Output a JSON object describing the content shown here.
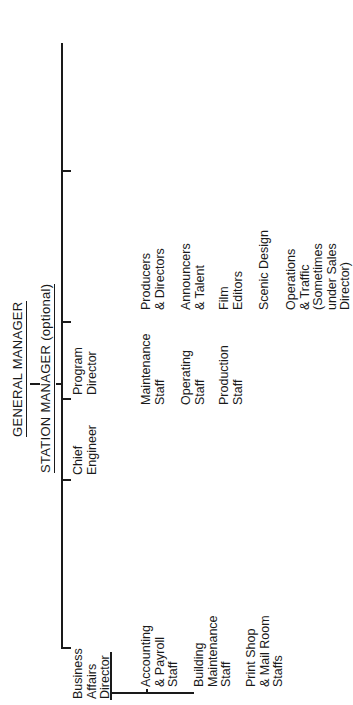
{
  "chart": {
    "title_top": "GENERAL MANAGER",
    "title_sub": "STATION MANAGER (optional)",
    "departments": [
      {
        "head": "Business\nAffairs\nDirector",
        "staff": [
          "Accounting\n& Payroll\nStaff",
          "Building\nMaintenance\nStaff",
          "Print Shop\n& Mail Room\nStaffs"
        ]
      },
      {
        "head": "Chief\nEngineer",
        "staff": [
          "Maintenance\nStaff",
          "Operating\nStaff",
          "Production\nStaff"
        ]
      },
      {
        "head": "Program\nDirector",
        "staff": [
          "Producers\n& Directors",
          "Announcers\n& Talent",
          "Film\nEditors",
          "Scenic Design",
          "Operations\n& Traffic\n(Sometimes\nunder Sales\nDirector)"
        ]
      },
      {
        "head": "Community\nAffairs\n(or Relations)\nDirector",
        "staff": [
          "FCC License",
          "Ascertainments",
          "Public Service"
        ]
      },
      {
        "head": "Sales\nDirector",
        "staff": [
          "Sales\nStaff",
          "Research\nStaff"
        ]
      },
      {
        "head": "Promotion\nDirector",
        "staff": [
          "Advertising\nStaff",
          "On-air Promo-\ntion Staff",
          "Publicity/Press\nStaff",
          "Graphics\nStaff\n(Sometimes\nunder Program\nDirector)"
        ]
      },
      {
        "head": "News\nDirector\n(Sometimes under\nProgram Director)",
        "staff": [
          "Producers",
          "Anchors &\nReporters",
          "Camera &\nTechnical\nCrews",
          "Editors"
        ]
      }
    ]
  }
}
